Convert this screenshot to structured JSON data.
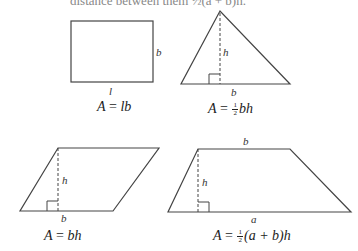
{
  "header": {
    "cutoff_text": "distance between them  ½(a + b)h."
  },
  "figures": [
    {
      "name": "rectangle",
      "labels": {
        "side": "b",
        "base": "l"
      },
      "formula": {
        "lhs": "A",
        "eq": "=",
        "rhs": "lb"
      }
    },
    {
      "name": "triangle",
      "labels": {
        "height": "h",
        "base": "b"
      },
      "formula": {
        "lhs": "A",
        "eq": "=",
        "frac_num": "1",
        "frac_den": "2",
        "rhs": "bh"
      }
    },
    {
      "name": "parallelogram",
      "labels": {
        "height": "h",
        "base": "b"
      },
      "formula": {
        "lhs": "A",
        "eq": "=",
        "rhs": "bh"
      }
    },
    {
      "name": "trapezoid",
      "labels": {
        "top": "b",
        "height": "h",
        "base": "a"
      },
      "formula": {
        "lhs": "A",
        "eq": "=",
        "frac_num": "1",
        "frac_den": "2",
        "rhs": "(a + b)h"
      }
    }
  ],
  "colors": {
    "stroke": "#333333",
    "background": "#ffffff"
  }
}
